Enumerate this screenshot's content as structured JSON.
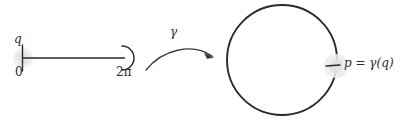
{
  "figure": {
    "background_color": "#ffffff",
    "stroke_color": "#2b2b2b",
    "highlight_color": "#e2e2e2",
    "width": 404,
    "height": 124
  },
  "domain_segment": {
    "name": "interval-[0,2pi)",
    "left_endpoint_label": "0",
    "right_endpoint_label": "2π",
    "point_label": "q",
    "left_endpoint_style": "closed-tick",
    "right_endpoint_style": "open-semicircle",
    "x_start": 22,
    "x_end": 126,
    "y": 58
  },
  "map_arrow": {
    "name": "gamma-map-arrow",
    "label": "γ",
    "from_x": 145,
    "to_x": 215,
    "description": "curved arrow from interval to circle"
  },
  "codomain_circle": {
    "name": "circle-S1",
    "center_x": 282,
    "center_y": 60,
    "radius_x": 55,
    "radius_y": 55,
    "point_marker_label": "p = γ(q)",
    "point_marker_x": 336,
    "point_marker_y": 66,
    "point_marker_style": "tick-with-halo"
  }
}
